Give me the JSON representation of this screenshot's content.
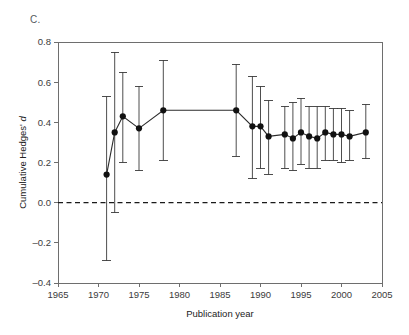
{
  "panel": {
    "label": "C."
  },
  "chart_data": {
    "type": "scatter",
    "title": "",
    "subtitle": "",
    "xlabel": "Publication year",
    "ylabel": "Cumulative Hedges' d",
    "ylabel_plain": "Cumulative Hedges'",
    "ylabel_italic": "d",
    "xlim": [
      1965,
      2005
    ],
    "ylim": [
      -0.4,
      0.8
    ],
    "xticks": [
      1965,
      1970,
      1975,
      1980,
      1985,
      1990,
      1995,
      2000,
      2005
    ],
    "xticklabels": [
      "1965",
      "1970",
      "1975",
      "1980",
      "1985",
      "1990",
      "1995",
      "2000",
      "2005"
    ],
    "yticks": [
      -0.4,
      -0.2,
      0.0,
      0.2,
      0.4,
      0.6,
      0.8
    ],
    "yticklabels": [
      "-0.4",
      "-0.2",
      "0.0",
      "0.2",
      "0.4",
      "0.6",
      "0.8"
    ],
    "grid": false,
    "legend": false,
    "reference_lines": [
      {
        "axis": "y",
        "value": 0.0,
        "style": "dashed",
        "color": "#1a1a1a"
      }
    ],
    "marker": "filled-circle",
    "marker_color": "#111111",
    "line_color": "#2c2c2c",
    "errorbar_color": "#3a3a3a",
    "x": [
      1971,
      1972,
      1973,
      1975,
      1978,
      1987,
      1989,
      1990,
      1991,
      1993,
      1994,
      1995,
      1996,
      1997,
      1998,
      1999,
      2000,
      2001,
      2003
    ],
    "values": [
      0.14,
      0.35,
      0.43,
      0.37,
      0.46,
      0.46,
      0.38,
      0.38,
      0.33,
      0.34,
      0.32,
      0.35,
      0.33,
      0.32,
      0.35,
      0.34,
      0.34,
      0.33,
      0.35
    ],
    "ci_lower": [
      -0.29,
      -0.05,
      0.2,
      0.16,
      0.21,
      0.23,
      0.12,
      0.17,
      0.14,
      0.17,
      0.16,
      0.19,
      0.17,
      0.17,
      0.21,
      0.21,
      0.2,
      0.21,
      0.22
    ],
    "ci_upper": [
      0.53,
      0.75,
      0.65,
      0.58,
      0.71,
      0.69,
      0.63,
      0.58,
      0.51,
      0.48,
      0.5,
      0.52,
      0.48,
      0.48,
      0.48,
      0.47,
      0.47,
      0.46,
      0.49
    ],
    "series": [
      {
        "name": "Cumulative Hedges' d",
        "values": [
          0.14,
          0.35,
          0.43,
          0.37,
          0.46,
          0.46,
          0.38,
          0.38,
          0.33,
          0.34,
          0.32,
          0.35,
          0.33,
          0.32,
          0.35,
          0.34,
          0.34,
          0.33,
          0.35
        ]
      }
    ]
  }
}
